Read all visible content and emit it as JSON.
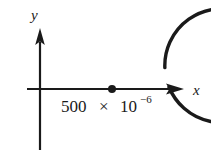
{
  "figure": {
    "type": "math-diagram",
    "background_color": "#ffffff",
    "stroke_color": "#1a1a1a",
    "axes": {
      "x_label": "x",
      "y_label": "y",
      "x_axis": {
        "y": 89,
        "x_start": 27,
        "x_end": 172,
        "arrow": "right"
      },
      "y_axis": {
        "x": 40,
        "y_start": 30,
        "y_end": 150,
        "arrow": "up"
      }
    },
    "circle": {
      "center_x": 112,
      "center_y": 89,
      "radius": 57,
      "stroke_width": 3,
      "gap_start_deg": 2,
      "gap_end_deg": 22,
      "closed": false
    },
    "center_point": {
      "x": 112,
      "y": 89,
      "radius": 4,
      "filled": true
    },
    "value_label": {
      "mantissa": "500",
      "operator": "×",
      "base": "10",
      "exponent": "−6",
      "full_text": "500 × 10−6"
    }
  }
}
